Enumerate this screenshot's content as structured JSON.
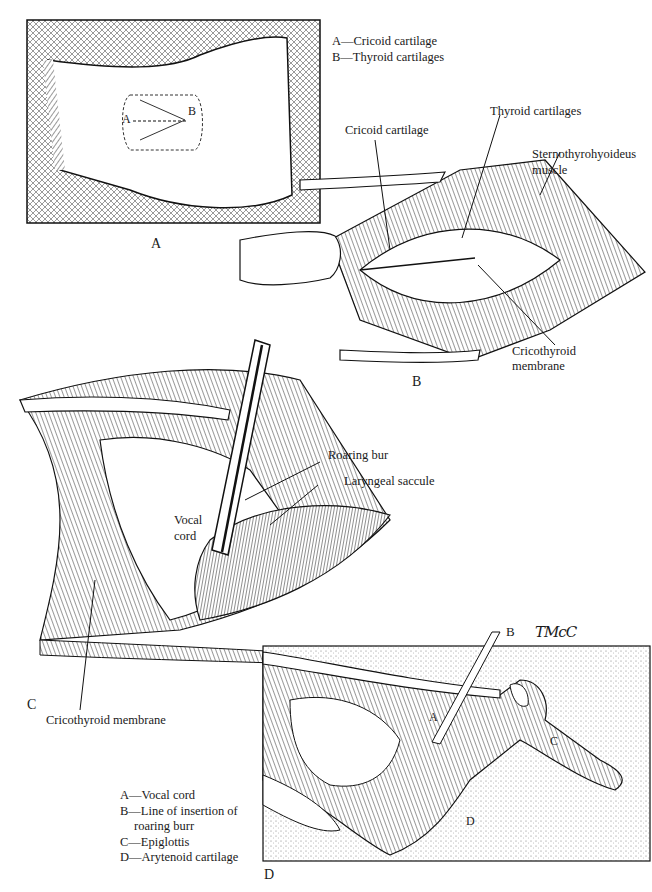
{
  "figure": {
    "panels": [
      {
        "id": "A",
        "letter": "A"
      },
      {
        "id": "B",
        "letter": "B"
      },
      {
        "id": "C",
        "letter": "C"
      },
      {
        "id": "D",
        "letter": "D"
      }
    ],
    "panel_a": {
      "legend": [
        "A—Cricoid cartilage",
        "B—Thyroid cartilages"
      ],
      "point_a": "A",
      "point_b": "B"
    },
    "panel_b": {
      "labels": {
        "cricoid": "Cricoid cartilage",
        "thyroid": "Thyroid cartilages",
        "sterno_1": "Sternothyrohyoideus",
        "sterno_2": "muscle",
        "crico_mem_1": "Cricothyroid",
        "crico_mem_2": "membrane"
      }
    },
    "panel_c": {
      "labels": {
        "roaring_bur": "Roaring bur",
        "laryngeal_saccule": "Laryngeal saccule",
        "vocal_1": "Vocal",
        "vocal_2": "cord",
        "cricothyroid_membrane": "Cricothyroid membrane"
      }
    },
    "panel_d": {
      "point_labels": {
        "a": "A",
        "b": "B",
        "c": "C",
        "d": "D"
      },
      "legend": {
        "a": "A—Vocal cord",
        "b": "B—Line of insertion of",
        "b_cont": "roaring burr",
        "c": "C—Epiglottis",
        "d": "D—Arytenoid cartilage"
      }
    },
    "signature": "TMcC",
    "colors": {
      "ink": "#1a1a1a",
      "paper": "#ffffff",
      "stipple": "#e6e6e6"
    }
  }
}
